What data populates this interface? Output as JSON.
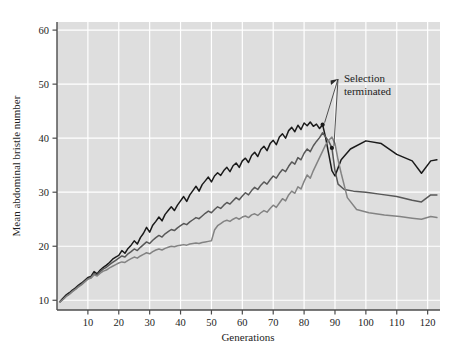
{
  "chart_data": {
    "type": "line",
    "title": "",
    "xlabel": "Generations",
    "ylabel": "Mean abdominal bristle number",
    "xlim": [
      0,
      124
    ],
    "ylim": [
      8.2,
      61.5
    ],
    "xticks": [
      10,
      20,
      30,
      40,
      50,
      60,
      70,
      80,
      90,
      100,
      110,
      120
    ],
    "yticks": [
      10,
      20,
      30,
      40,
      50,
      60
    ],
    "grid": "both",
    "legend_position": "none",
    "annotations": [
      {
        "text": "Selection terminated",
        "text_line_1": "Selection",
        "text_line_2": "terminated",
        "arrow_targets": [
          {
            "x": 86,
            "y": 42.5
          },
          {
            "x": 89,
            "y": 38.2
          }
        ]
      }
    ],
    "series": [
      {
        "name": "line-1-dark",
        "color": "#1a1a1a",
        "termination_generation": 86,
        "x": [
          1,
          2,
          3,
          4,
          5,
          6,
          7,
          8,
          9,
          10,
          11,
          12,
          13,
          14,
          15,
          16,
          17,
          18,
          19,
          20,
          21,
          22,
          23,
          24,
          25,
          26,
          27,
          28,
          29,
          30,
          31,
          32,
          33,
          34,
          35,
          36,
          37,
          38,
          39,
          40,
          41,
          42,
          43,
          44,
          45,
          46,
          47,
          48,
          49,
          50,
          51,
          52,
          53,
          54,
          55,
          56,
          57,
          58,
          59,
          60,
          61,
          62,
          63,
          64,
          65,
          66,
          67,
          68,
          69,
          70,
          71,
          72,
          73,
          74,
          75,
          76,
          77,
          78,
          79,
          80,
          81,
          82,
          83,
          84,
          85,
          86,
          87,
          88,
          89,
          90,
          91,
          92,
          95,
          100,
          105,
          110,
          115,
          118,
          121,
          123
        ],
        "y": [
          9.8,
          10.4,
          11.0,
          11.4,
          11.9,
          12.3,
          12.8,
          13.2,
          13.7,
          14.2,
          14.4,
          15.3,
          14.9,
          15.6,
          16.1,
          16.5,
          17.0,
          17.6,
          18.0,
          18.3,
          19.2,
          18.7,
          19.6,
          20.2,
          21.0,
          20.4,
          21.6,
          22.4,
          23.5,
          22.6,
          23.9,
          24.6,
          25.4,
          24.7,
          25.9,
          26.6,
          27.3,
          26.6,
          27.6,
          28.4,
          29.2,
          28.3,
          29.5,
          30.3,
          31.1,
          30.2,
          31.4,
          32.1,
          32.8,
          31.9,
          33.0,
          33.6,
          33.1,
          34.0,
          34.6,
          33.8,
          34.9,
          35.4,
          34.6,
          35.8,
          36.3,
          35.5,
          36.8,
          37.4,
          36.6,
          37.9,
          38.5,
          37.7,
          39.0,
          39.6,
          38.8,
          40.2,
          40.8,
          40.0,
          41.4,
          42.0,
          41.2,
          42.4,
          41.6,
          42.8,
          42.3,
          43.0,
          42.2,
          42.6,
          41.8,
          42.5,
          40.0,
          37.0,
          34.0,
          33.0,
          34.5,
          36.0,
          38.0,
          39.5,
          39.0,
          37.0,
          35.8,
          33.5,
          35.8,
          36.0
        ]
      },
      {
        "name": "line-2-mid-grey",
        "color": "#585858",
        "termination_generation": 89,
        "x": [
          1,
          2,
          3,
          4,
          5,
          6,
          7,
          8,
          9,
          10,
          11,
          12,
          13,
          14,
          15,
          16,
          17,
          18,
          19,
          20,
          21,
          22,
          23,
          24,
          25,
          26,
          27,
          28,
          29,
          30,
          31,
          32,
          33,
          34,
          35,
          36,
          37,
          38,
          39,
          40,
          41,
          42,
          43,
          44,
          45,
          46,
          47,
          48,
          49,
          50,
          51,
          52,
          53,
          54,
          55,
          56,
          57,
          58,
          59,
          60,
          61,
          62,
          63,
          64,
          65,
          66,
          67,
          68,
          69,
          70,
          71,
          72,
          73,
          74,
          75,
          76,
          77,
          78,
          79,
          80,
          81,
          82,
          83,
          84,
          85,
          86,
          87,
          88,
          89,
          90,
          91,
          93,
          96,
          100,
          105,
          110,
          115,
          118,
          121,
          123
        ],
        "y": [
          9.7,
          10.2,
          10.8,
          11.2,
          11.7,
          12.1,
          12.6,
          13.0,
          13.5,
          14.0,
          14.2,
          14.9,
          14.7,
          15.3,
          15.8,
          16.1,
          16.6,
          17.0,
          17.4,
          17.8,
          18.2,
          18.0,
          18.6,
          19.0,
          19.5,
          19.2,
          19.8,
          20.3,
          20.8,
          20.5,
          21.1,
          21.6,
          22.0,
          21.7,
          22.3,
          22.7,
          23.1,
          22.9,
          23.4,
          23.8,
          24.2,
          24.0,
          24.5,
          24.9,
          25.3,
          25.1,
          25.6,
          26.1,
          26.5,
          26.2,
          26.8,
          27.3,
          27.0,
          27.6,
          28.1,
          27.8,
          28.4,
          29.0,
          28.6,
          29.3,
          29.9,
          29.5,
          30.3,
          30.9,
          30.5,
          31.3,
          31.9,
          31.5,
          32.3,
          33.0,
          32.6,
          33.5,
          34.2,
          33.8,
          34.8,
          35.6,
          35.2,
          36.4,
          36.0,
          37.2,
          38.0,
          37.5,
          38.6,
          39.4,
          40.1,
          41.0,
          40.2,
          39.4,
          38.2,
          34.0,
          31.5,
          30.5,
          30.2,
          30.0,
          29.6,
          29.2,
          28.5,
          28.2,
          29.5,
          29.5
        ]
      },
      {
        "name": "line-3-light-grey",
        "color": "#838383",
        "termination_generation": 92,
        "x": [
          1,
          2,
          3,
          4,
          5,
          6,
          7,
          8,
          9,
          10,
          11,
          12,
          13,
          14,
          15,
          16,
          17,
          18,
          19,
          20,
          21,
          22,
          23,
          24,
          25,
          26,
          27,
          28,
          29,
          30,
          31,
          32,
          33,
          34,
          35,
          36,
          37,
          38,
          39,
          40,
          41,
          42,
          43,
          44,
          45,
          46,
          47,
          48,
          49,
          50,
          51,
          52,
          53,
          54,
          55,
          56,
          57,
          58,
          59,
          60,
          61,
          62,
          63,
          64,
          65,
          66,
          67,
          68,
          69,
          70,
          71,
          72,
          73,
          74,
          75,
          76,
          77,
          78,
          79,
          80,
          81,
          82,
          83,
          84,
          85,
          86,
          87,
          88,
          89,
          90,
          91,
          92,
          94,
          97,
          101,
          106,
          111,
          115,
          118,
          121,
          123
        ],
        "y": [
          9.7,
          10.2,
          10.7,
          11.1,
          11.6,
          12.0,
          12.5,
          12.9,
          13.4,
          13.9,
          14.1,
          14.7,
          14.5,
          15.0,
          15.4,
          15.6,
          16.0,
          16.3,
          16.6,
          16.9,
          17.1,
          17.0,
          17.4,
          17.7,
          18.0,
          17.8,
          18.2,
          18.5,
          18.8,
          18.6,
          19.0,
          19.3,
          19.5,
          19.3,
          19.6,
          19.8,
          20.0,
          19.9,
          20.1,
          20.2,
          20.3,
          20.2,
          20.4,
          20.5,
          20.6,
          20.5,
          20.7,
          20.8,
          20.9,
          21.0,
          23.0,
          23.8,
          24.2,
          24.6,
          24.8,
          24.6,
          25.0,
          25.3,
          25.0,
          25.4,
          25.6,
          25.3,
          25.8,
          26.0,
          25.7,
          26.2,
          26.6,
          26.3,
          27.0,
          27.6,
          27.2,
          28.0,
          28.8,
          28.4,
          29.5,
          30.2,
          29.8,
          31.0,
          30.6,
          32.0,
          33.2,
          32.6,
          34.0,
          35.2,
          36.4,
          37.6,
          38.8,
          39.6,
          40.2,
          39.0,
          36.0,
          33.5,
          29.0,
          26.8,
          26.2,
          25.8,
          25.5,
          25.2,
          25.0,
          25.5,
          25.3
        ]
      }
    ]
  }
}
